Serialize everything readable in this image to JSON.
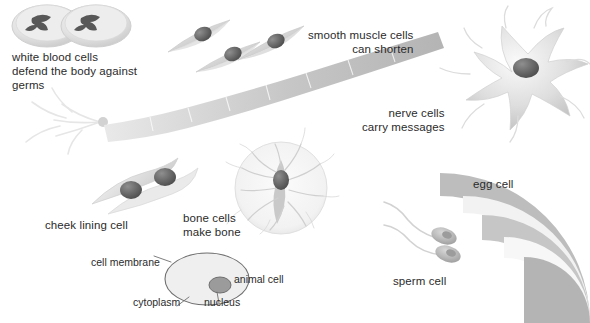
{
  "figure": {
    "background_color": "#ffffff",
    "text_color": "#2b2b2b"
  },
  "captions": {
    "white_blood_cells": "white blood cells\ndefend the body against\ngerms",
    "smooth_muscle_cells": "smooth muscle cells\ncan shorten",
    "nerve_cells": "nerve cells\ncarry messages",
    "cheek_lining_cell": "cheek lining cell",
    "bone_cells": "bone cells\nmake bone",
    "egg_cell": "egg cell",
    "sperm_cell": "sperm cell"
  },
  "animal_cell_diagram": {
    "cell_membrane": "cell membrane",
    "cytoplasm": "cytoplasm",
    "nucleus": "nucleus",
    "animal_cell": "animal cell"
  },
  "palette": {
    "cell_light": "#e6e6e6",
    "cell_mid": "#c9c9c9",
    "cell_dark": "#8d8d8d",
    "nucleus_dark": "#4a4a4a",
    "outline": "#9a9a9a",
    "faint": "#efefef"
  }
}
